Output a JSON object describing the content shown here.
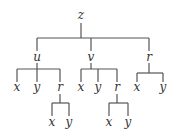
{
  "tree": {
    "root": "z",
    "level1": [
      "u",
      "v",
      "r"
    ],
    "u_children": [
      "x",
      "y",
      "r"
    ],
    "u_r_children": [
      "x",
      "y"
    ],
    "v_children": [
      "x",
      "y",
      "r"
    ],
    "v_r_children": [
      "x",
      "y"
    ],
    "r_children": [
      "x",
      "y"
    ]
  }
}
